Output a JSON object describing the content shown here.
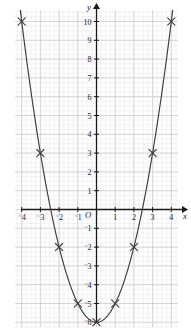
{
  "chart_data": {
    "type": "line",
    "title": "",
    "subtitle": "",
    "xlabel": "x",
    "ylabel": "y",
    "origin_label": "O",
    "xlim": [
      -4.35,
      4.35
    ],
    "ylim": [
      -6.25,
      10.6
    ],
    "grid": true,
    "minor_grid": true,
    "minor_grid_divisions": 4,
    "legend": null,
    "legend_position": "none",
    "x_ticks": [
      -4,
      -3,
      -2,
      -1,
      1,
      2,
      3,
      4
    ],
    "x_tick_labels": [
      "⁻4",
      "⁻3",
      "⁻2",
      "⁻1",
      "1",
      "2",
      "3",
      "4"
    ],
    "y_ticks": [
      -6,
      -5,
      -4,
      -3,
      -2,
      -1,
      1,
      2,
      3,
      4,
      5,
      6,
      7,
      8,
      9,
      10
    ],
    "y_tick_labels": [
      "⁻6",
      "⁻5",
      "⁻4",
      "⁻3",
      "⁻2",
      "⁻1",
      "1",
      "2",
      "3",
      "4",
      "5",
      "6",
      "7",
      "8",
      "9",
      "10"
    ],
    "series": [
      {
        "name": "y = x² − 6",
        "marker": "cross",
        "x": [
          -4,
          -3,
          -2,
          -1,
          0,
          1,
          2,
          3,
          4
        ],
        "values": [
          10,
          3,
          -2,
          -5,
          -6,
          -5,
          -2,
          3,
          10
        ]
      }
    ],
    "curve_color": "#3c3c3c",
    "grid_color": "#c8c8cc",
    "minor_grid_color": "#e6e6ea",
    "axis_color": "#1a1a1a",
    "marker_color": "#3c3c3c"
  }
}
